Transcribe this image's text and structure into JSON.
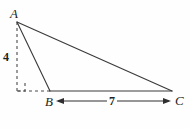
{
  "figure": {
    "name": "triangle-diagram",
    "background_color": "#fefefe",
    "stroke_color": "#3a3a3a",
    "label_color": "#231f20",
    "width": 190,
    "height": 129
  },
  "vertices": {
    "A": {
      "label": "A",
      "x": 17,
      "y": 22
    },
    "B": {
      "label": "B",
      "x": 50,
      "y": 91
    },
    "C": {
      "label": "C",
      "x": 172,
      "y": 91
    }
  },
  "measurements": {
    "height": {
      "label": "4",
      "value": 4,
      "describes": "altitude from A to line BC"
    },
    "base": {
      "label": "7",
      "value": 7,
      "describes": "segment from B to C"
    }
  },
  "edges": [
    {
      "name": "edge-AB",
      "from": "A",
      "to": "B",
      "style": "solid"
    },
    {
      "name": "edge-AC",
      "from": "A",
      "to": "C",
      "style": "solid"
    },
    {
      "name": "edge-BC",
      "from": "B",
      "to": "C",
      "style": "solid"
    }
  ],
  "construction": [
    {
      "name": "altitude-dashed",
      "from": [
        17,
        22
      ],
      "to": [
        17,
        91
      ],
      "style": "dashed"
    },
    {
      "name": "base-extension-dashed",
      "from": [
        17,
        91
      ],
      "to": [
        50,
        91
      ],
      "style": "dashed"
    },
    {
      "name": "right-angle-marker",
      "at": [
        17,
        91
      ],
      "size": 8,
      "style": "dashed"
    }
  ],
  "dimension_arrow": {
    "name": "base-dimension-arrow",
    "from": [
      56,
      101
    ],
    "to": [
      171,
      101
    ],
    "double_headed": true
  }
}
